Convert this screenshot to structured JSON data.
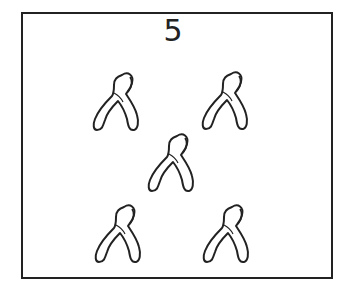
{
  "card": {
    "count_label": "5",
    "item_icon": "wishbone-icon",
    "items": [
      {
        "name": "wishbone-1",
        "x": 92,
        "y": 69
      },
      {
        "name": "wishbone-2",
        "x": 201,
        "y": 68
      },
      {
        "name": "wishbone-3",
        "x": 147,
        "y": 130
      },
      {
        "name": "wishbone-4",
        "x": 94,
        "y": 201
      },
      {
        "name": "wishbone-5",
        "x": 202,
        "y": 201
      }
    ],
    "stroke_color": "#222222",
    "background_color": "#ffffff"
  }
}
